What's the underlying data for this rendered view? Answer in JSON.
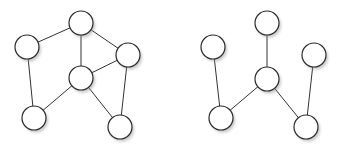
{
  "diagram": {
    "width": 342,
    "height": 147,
    "node_radius": 12,
    "colors": {
      "background": "#ffffff",
      "edge": "#333333",
      "node_fill": "#ffffff",
      "node_stroke": "#2a2a2a"
    },
    "graphs": [
      {
        "name": "left-graph",
        "nodes": [
          {
            "id": "A",
            "x": 81,
            "y": 23
          },
          {
            "id": "B",
            "x": 27,
            "y": 47
          },
          {
            "id": "C",
            "x": 128,
            "y": 55
          },
          {
            "id": "D",
            "x": 81,
            "y": 78
          },
          {
            "id": "E",
            "x": 34,
            "y": 118
          },
          {
            "id": "F",
            "x": 120,
            "y": 127
          }
        ],
        "edges": [
          [
            "A",
            "B"
          ],
          [
            "A",
            "D"
          ],
          [
            "A",
            "C"
          ],
          [
            "B",
            "E"
          ],
          [
            "C",
            "D"
          ],
          [
            "C",
            "F"
          ],
          [
            "D",
            "E"
          ],
          [
            "D",
            "F"
          ]
        ]
      },
      {
        "name": "right-graph",
        "nodes": [
          {
            "id": "A",
            "x": 267,
            "y": 23
          },
          {
            "id": "B",
            "x": 213,
            "y": 47
          },
          {
            "id": "C",
            "x": 314,
            "y": 55
          },
          {
            "id": "D",
            "x": 267,
            "y": 79
          },
          {
            "id": "E",
            "x": 221,
            "y": 118
          },
          {
            "id": "F",
            "x": 306,
            "y": 127
          }
        ],
        "edges": [
          [
            "A",
            "D"
          ],
          [
            "B",
            "E"
          ],
          [
            "C",
            "F"
          ],
          [
            "D",
            "E"
          ],
          [
            "D",
            "F"
          ]
        ]
      }
    ]
  }
}
